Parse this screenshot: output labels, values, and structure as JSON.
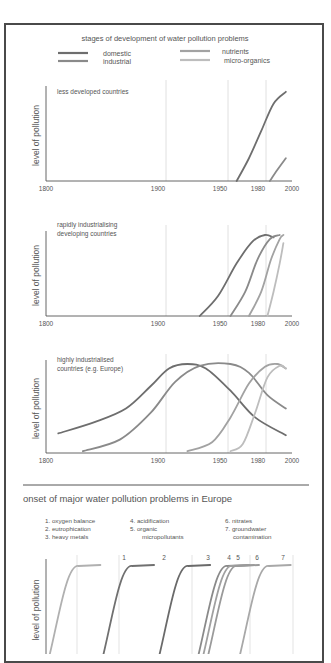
{
  "chart_data": [
    {
      "type": "line",
      "title": "stages of development of water pollution problems",
      "subtitle": "less developed countries",
      "xlabel": "",
      "ylabel": "level of pollution",
      "xticks": [
        "1800",
        "1900",
        "1950",
        "1980",
        "2000"
      ],
      "xlim": [
        1800,
        2000
      ],
      "ylim": [
        0,
        1
      ],
      "gridlines": [
        1900,
        1950,
        1980
      ],
      "legend": [
        {
          "name": "domestic",
          "color": "#6e6e6e"
        },
        {
          "name": "industrial",
          "color": "#8a8a8a"
        },
        {
          "name": "nutrients",
          "color": "#a2a2a2"
        },
        {
          "name": "micro-organics",
          "color": "#bdbdbd"
        }
      ],
      "series": [
        {
          "name": "domestic",
          "x": [
            1955,
            1965,
            1975,
            1985,
            1995
          ],
          "y": [
            0.0,
            0.25,
            0.55,
            0.85,
            0.98
          ]
        },
        {
          "name": "industrial",
          "x": [
            1982,
            1988,
            1995
          ],
          "y": [
            0.0,
            0.12,
            0.25
          ]
        }
      ]
    },
    {
      "type": "line",
      "subtitle": "rapidly industrialising developing countries",
      "ylabel": "level of pollution",
      "xticks": [
        "1800",
        "1900",
        "1950",
        "1980",
        "2000"
      ],
      "xlim": [
        1800,
        2000
      ],
      "ylim": [
        0,
        1
      ],
      "gridlines": [
        1900,
        1950,
        1980
      ],
      "series": [
        {
          "name": "domestic",
          "x": [
            1925,
            1940,
            1955,
            1968,
            1978,
            1985
          ],
          "y": [
            0.0,
            0.25,
            0.65,
            0.92,
            1.0,
            0.97
          ]
        },
        {
          "name": "industrial",
          "x": [
            1950,
            1962,
            1972,
            1982,
            1990
          ],
          "y": [
            0.0,
            0.3,
            0.7,
            0.95,
            1.0
          ]
        },
        {
          "name": "nutrients",
          "x": [
            1965,
            1975,
            1983,
            1990,
            1993
          ],
          "y": [
            0.0,
            0.3,
            0.7,
            0.95,
            1.0
          ]
        },
        {
          "name": "micro-organics",
          "x": [
            1980,
            1985,
            1990,
            1993
          ],
          "y": [
            0.0,
            0.3,
            0.65,
            0.9
          ]
        }
      ]
    },
    {
      "type": "line",
      "subtitle": "highly industrialised countries (e.g. Europe)",
      "ylabel": "level of pollution",
      "xticks": [
        "1800",
        "1900",
        "1950",
        "1980",
        "2000"
      ],
      "xlim": [
        1800,
        2000
      ],
      "ylim": [
        0,
        1
      ],
      "gridlines": [
        1900,
        1950,
        1980
      ],
      "series": [
        {
          "name": "domestic",
          "x": [
            1810,
            1840,
            1865,
            1885,
            1900,
            1915,
            1930,
            1950,
            1970,
            1995
          ],
          "y": [
            0.22,
            0.35,
            0.5,
            0.75,
            0.95,
            1.0,
            0.95,
            0.7,
            0.4,
            0.2
          ]
        },
        {
          "name": "industrial",
          "x": [
            1830,
            1860,
            1885,
            1905,
            1925,
            1950,
            1965,
            1980,
            1995
          ],
          "y": [
            0.02,
            0.15,
            0.45,
            0.8,
            0.98,
            1.0,
            0.9,
            0.65,
            0.5
          ]
        },
        {
          "name": "nutrients",
          "x": [
            1915,
            1935,
            1950,
            1965,
            1978,
            1988,
            1995
          ],
          "y": [
            0.02,
            0.12,
            0.4,
            0.78,
            0.97,
            1.0,
            0.95
          ]
        },
        {
          "name": "micro-organics",
          "x": [
            1950,
            1960,
            1970,
            1980,
            1990,
            1995
          ],
          "y": [
            0.02,
            0.1,
            0.45,
            0.85,
            0.98,
            0.95
          ]
        }
      ]
    },
    {
      "type": "line",
      "title": "onset of major water pollution problems in Europe",
      "ylabel": "level of pollution",
      "legend": [
        "1. oxygen balance",
        "2. eutrophication",
        "3. heavy metals",
        "4. acidification",
        "5. organic micropollutants",
        "6. nitrates",
        "7. groundwater contamination"
      ],
      "series": [
        {
          "name": "1",
          "label": "1",
          "color": "#b0b0b0",
          "onset_rel": 0.1
        },
        {
          "name": "2",
          "label": "2",
          "color": "#707070",
          "onset_rel": 0.32
        },
        {
          "name": "3",
          "label": "3",
          "color": "#6a6a6a",
          "onset_rel": 0.55
        },
        {
          "name": "4",
          "label": "4",
          "color": "#8a8a8a",
          "onset_rel": 0.71
        },
        {
          "name": "4b",
          "label": "",
          "color": "#a0a0a0",
          "onset_rel": 0.73
        },
        {
          "name": "5",
          "label": "5",
          "color": "#9a9a9a",
          "onset_rel": 0.75
        },
        {
          "name": "7",
          "label": "7",
          "color": "#a8a8a8",
          "onset_rel": 0.88
        }
      ],
      "number_labels": [
        "1",
        "2",
        "3",
        "4",
        "5",
        "6",
        "7"
      ]
    }
  ]
}
